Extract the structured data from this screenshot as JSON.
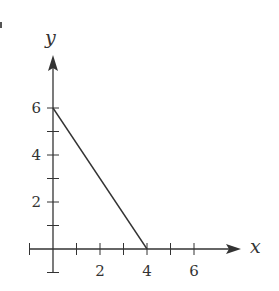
{
  "chart_data": {
    "type": "line",
    "title": "",
    "xlabel": "x",
    "ylabel": "y",
    "xlim": [
      -1,
      7.5
    ],
    "ylim": [
      -1,
      7.8
    ],
    "grid": false,
    "legend": null,
    "x_ticks": [
      -1,
      0,
      1,
      2,
      3,
      4,
      5,
      6
    ],
    "x_tick_labels": [
      "2",
      "4",
      "6"
    ],
    "x_tick_label_values": [
      2,
      4,
      6
    ],
    "y_ticks": [
      -1,
      0,
      1,
      2,
      3,
      4,
      5,
      6
    ],
    "y_tick_labels": [
      "2",
      "4",
      "6"
    ],
    "y_tick_label_values": [
      2,
      4,
      6
    ],
    "series": [
      {
        "name": "segment",
        "x": [
          0,
          4
        ],
        "y": [
          6,
          0
        ],
        "color": "#333333"
      }
    ]
  },
  "style": {
    "axis_color": "#333333",
    "line_color": "#333333",
    "background": "#ffffff"
  }
}
